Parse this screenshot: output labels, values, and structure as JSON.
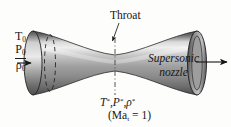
{
  "figure": {
    "background_color": "#fdfdfc",
    "ink_color": "#161616"
  },
  "inlet": {
    "stagnation_temperature": "T",
    "stagnation_temperature_sub": "0",
    "stagnation_pressure": "P",
    "stagnation_pressure_sub": "0",
    "stagnation_density": "ρ",
    "stagnation_density_sub": "0",
    "flow_arrow": "inlet-flow-arrow"
  },
  "throat": {
    "label": "Throat",
    "leader": "throat-leader-line",
    "centerline": "throat-centerline"
  },
  "nozzle": {
    "label_line1": "Supersonic",
    "label_line2": "nozzle",
    "body_light": "#e6e6e6",
    "body_mid": "#9a9a9a",
    "body_dark": "#4a4a4a",
    "outline": "#1f1f1f"
  },
  "throat_properties": {
    "temperature": "T",
    "pressure": "P",
    "density": "ρ",
    "star": "*",
    "separator": ",",
    "mach_text": "(Ma",
    "mach_sub": "t",
    "mach_value": " = 1)"
  },
  "exit": {
    "flow_arrow": "exit-flow-arrow"
  }
}
